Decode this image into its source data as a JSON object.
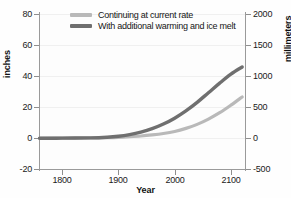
{
  "chart_data": {
    "type": "line",
    "title": "",
    "xlabel": "Year",
    "ylabel": "inches",
    "ylabel_right": "millimeters",
    "xlim": [
      1759,
      2125
    ],
    "ylim": [
      -20,
      80
    ],
    "ylim_right": [
      -500,
      2000
    ],
    "grid": true,
    "legend_position": "top-center",
    "x_ticks": [
      "1800",
      "1900",
      "2000",
      "2100"
    ],
    "x_tick_values": [
      1800,
      1900,
      2000,
      2100
    ],
    "y_ticks_left": [
      "80",
      "60",
      "40",
      "20",
      "0",
      "-20"
    ],
    "y_tick_values_left": [
      80,
      60,
      40,
      20,
      0,
      -20
    ],
    "y_ticks_right": [
      "2000",
      "1500",
      "1000",
      "500",
      "0",
      "-500"
    ],
    "y_tick_values_right": [
      2000,
      1500,
      1000,
      500,
      0,
      -500
    ],
    "series": [
      {
        "name": "Continuing at current rate",
        "color": "#b9b9b9",
        "x": [
          1760,
          1800,
          1850,
          1880,
          1900,
          1920,
          1940,
          1960,
          1980,
          2000,
          2020,
          2040,
          2060,
          2080,
          2100,
          2120
        ],
        "values": [
          -0.2,
          -0.1,
          0.0,
          0.2,
          0.4,
          0.8,
          1.3,
          2.0,
          2.9,
          4.2,
          6.2,
          8.8,
          12.2,
          16.3,
          21.2,
          26.5
        ]
      },
      {
        "name": "With additional warming and ice melt",
        "color": "#6f6f6f",
        "x": [
          1760,
          1800,
          1850,
          1880,
          1900,
          1920,
          1940,
          1960,
          1980,
          2000,
          2020,
          2040,
          2060,
          2080,
          2100,
          2120
        ],
        "values": [
          -0.2,
          -0.1,
          0.1,
          0.5,
          1.1,
          2.2,
          3.8,
          6.0,
          9.0,
          12.8,
          17.5,
          23.0,
          29.2,
          35.4,
          41.2,
          45.8
        ]
      }
    ]
  },
  "legend": {
    "items": [
      {
        "label": "Continuing at current rate",
        "color": "#b9b9b9"
      },
      {
        "label": "With additional warming and ice melt",
        "color": "#6f6f6f"
      }
    ]
  },
  "axes": {
    "x_title": "Year",
    "y_left_title": "inches",
    "y_right_title": "millimeters"
  }
}
